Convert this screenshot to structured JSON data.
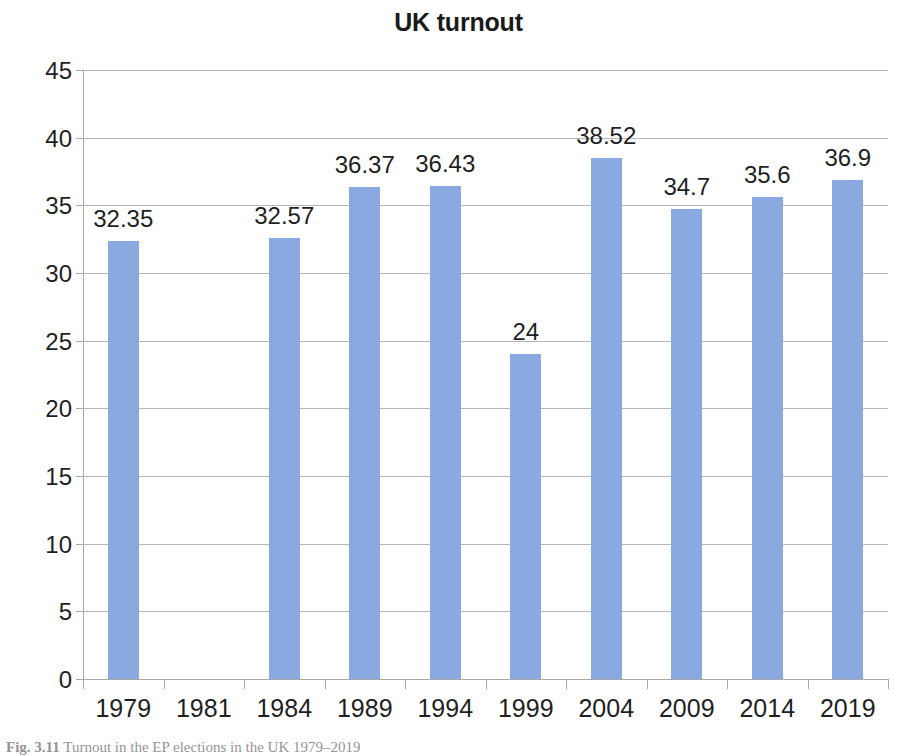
{
  "chart_data": {
    "type": "bar",
    "title": "UK turnout",
    "xlabel": "",
    "ylabel": "",
    "categories": [
      "1979",
      "1981",
      "1984",
      "1989",
      "1994",
      "1999",
      "2004",
      "2009",
      "2014",
      "2019"
    ],
    "values": [
      32.35,
      null,
      32.57,
      36.37,
      36.43,
      24,
      38.52,
      34.7,
      35.6,
      36.9
    ],
    "data_labels": [
      "32.35",
      "",
      "32.57",
      "36.37",
      "36.43",
      "24",
      "38.52",
      "34.7",
      "35.6",
      "36.9"
    ],
    "ylim": [
      0,
      45
    ],
    "ytick_labels": [
      "45",
      "40",
      "35",
      "30",
      "25",
      "20",
      "15",
      "10",
      "5",
      "0"
    ],
    "ytick_values": [
      45,
      40,
      35,
      30,
      25,
      20,
      15,
      10,
      5,
      0
    ],
    "ystep": 5,
    "grid": true,
    "legend": false,
    "series": [
      {
        "name": "UK turnout",
        "color": "#8aa9e0",
        "values": [
          32.35,
          null,
          32.57,
          36.37,
          36.43,
          24,
          38.52,
          34.7,
          35.6,
          36.9
        ]
      }
    ]
  },
  "caption": {
    "label": "Fig. 3.11",
    "text": "Turnout in the EP elections in the UK 1979–2019"
  },
  "colors": {
    "bar": "#8aa9e0",
    "grid": "#b7b7b7",
    "axis": "#a8a8a8",
    "text": "#1f1f1f",
    "background": "#ffffff"
  }
}
